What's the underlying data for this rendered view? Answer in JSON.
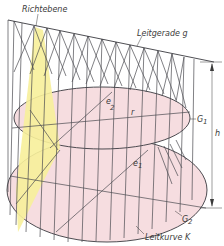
{
  "diagram": {
    "type": "ruled-surface (conoid) construction drawing",
    "labels": {
      "richtebene": "Richtebene",
      "leitgerade": "Leitgerade g",
      "e2": "e",
      "e2_sub": "2",
      "r": "r",
      "g1": "G",
      "g1_sub": "1",
      "e1": "e",
      "e1_sub": "1",
      "h": "h",
      "g2": "G",
      "g2_sub": "2",
      "leitkurve": "Leitkurve K"
    },
    "colors": {
      "directing_plane_fill": "#f7f09a",
      "ellipse_fill": "#f6dde0",
      "line": "#4a4a50",
      "background": "#ffffff"
    }
  }
}
